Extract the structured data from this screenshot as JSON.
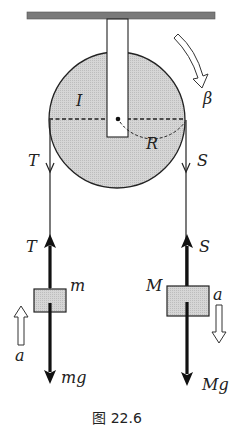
{
  "diagram": {
    "caption": "图 22.6",
    "pulley": {
      "inertia_label": "I",
      "radius_label": "R",
      "angular_accel_label": "β",
      "fill": "#d3d3d3"
    },
    "left_side": {
      "rope_tension_label_top": "T",
      "rope_tension_label_bottom": "T",
      "mass_label": "m",
      "weight_label": "mg",
      "accel_label": "a",
      "accel_direction": "up"
    },
    "right_side": {
      "rope_tension_label_top": "S",
      "rope_tension_label_bottom": "S",
      "mass_label": "M",
      "weight_label": "Mg",
      "accel_label": "a",
      "accel_direction": "down"
    },
    "colors": {
      "ceiling": "#7a7a7a",
      "line": "#222222",
      "block_fill": "#d8d8d8"
    }
  }
}
